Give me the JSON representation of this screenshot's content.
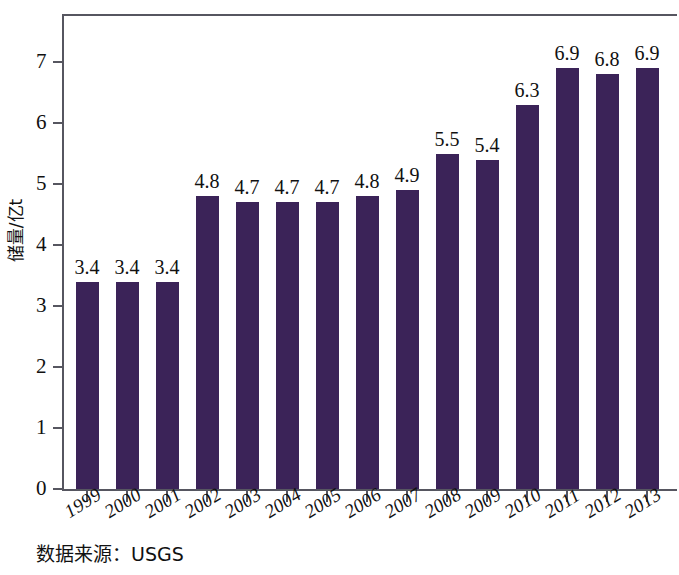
{
  "caption": "数据来源：USGS",
  "colors": {
    "bar": "#3b2358",
    "axis": "#565660",
    "background": "#ffffff",
    "text": "#111111"
  },
  "chart_data": {
    "type": "bar",
    "title": "",
    "xlabel": "",
    "ylabel": "储量/亿t",
    "categories": [
      "1999",
      "2000",
      "2001",
      "2002",
      "2003",
      "2004",
      "2005",
      "2006",
      "2007",
      "2008",
      "2009",
      "2010",
      "2011",
      "2012",
      "2013"
    ],
    "values": [
      3.4,
      3.4,
      3.4,
      4.8,
      4.7,
      4.7,
      4.7,
      4.8,
      4.9,
      5.5,
      5.4,
      6.3,
      6.9,
      6.8,
      6.9
    ],
    "data_labels": [
      "3.4",
      "3.4",
      "3.4",
      "4.8",
      "4.7",
      "4.7",
      "4.7",
      "4.8",
      "4.9",
      "5.5",
      "5.4",
      "6.3",
      "6.9",
      "6.8",
      "6.9"
    ],
    "ylim": [
      0,
      7.8
    ],
    "yticks": [
      0,
      1,
      2,
      3,
      4,
      5,
      6,
      7
    ],
    "ytick_labels": [
      "0",
      "1",
      "2",
      "3",
      "4",
      "5",
      "6",
      "7"
    ],
    "grid": false,
    "legend": null,
    "series": [
      {
        "name": "储量",
        "values": [
          3.4,
          3.4,
          3.4,
          4.8,
          4.7,
          4.7,
          4.7,
          4.8,
          4.9,
          5.5,
          5.4,
          6.3,
          6.9,
          6.8,
          6.9
        ]
      }
    ]
  }
}
